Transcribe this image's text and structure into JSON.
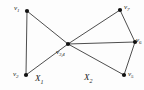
{
  "figure": {
    "background_color": "#fdfdfd",
    "stroke_color": "#3a3a3a",
    "vertex_color": "#111111",
    "label_color": "#1a1a1a"
  },
  "vertices": [
    {
      "id": "v1",
      "label": "v",
      "sub": "1",
      "x": 27,
      "y": 11,
      "label_x": 14,
      "label_y": 5
    },
    {
      "id": "v2",
      "label": "v",
      "sub": "2",
      "x": 26,
      "y": 75,
      "label_x": 13,
      "label_y": 71
    },
    {
      "id": "v34",
      "label": "v",
      "sub": "3,4",
      "x": 68,
      "y": 44,
      "label_x": 56,
      "label_y": 49
    },
    {
      "id": "v5",
      "label": "v",
      "sub": "5",
      "x": 124,
      "y": 75,
      "label_x": 128,
      "label_y": 71
    },
    {
      "id": "v6",
      "label": "v",
      "sub": "6",
      "x": 135,
      "y": 42,
      "label_x": 136,
      "label_y": 37
    },
    {
      "id": "v7",
      "label": "v",
      "sub": "7",
      "x": 120,
      "y": 10,
      "label_x": 124,
      "label_y": 4
    }
  ],
  "edges": [
    {
      "id": "e-v1-v2",
      "from": "v1",
      "to": "v2"
    },
    {
      "id": "e-v1-v34",
      "from": "v1",
      "to": "v34"
    },
    {
      "id": "e-v2-v34",
      "from": "v2",
      "to": "v34"
    },
    {
      "id": "e-v34-v7",
      "from": "v34",
      "to": "v7"
    },
    {
      "id": "e-v34-v6",
      "from": "v34",
      "to": "v6"
    },
    {
      "id": "e-v34-v5",
      "from": "v34",
      "to": "v5"
    },
    {
      "id": "e-v7-v6",
      "from": "v7",
      "to": "v6"
    },
    {
      "id": "e-v6-v5",
      "from": "v6",
      "to": "v5"
    }
  ],
  "regions": [
    {
      "id": "X1",
      "label": "X",
      "sub": "1",
      "x": 35,
      "y": 74
    },
    {
      "id": "X2",
      "label": "X",
      "sub": "2",
      "x": 84,
      "y": 73
    }
  ]
}
